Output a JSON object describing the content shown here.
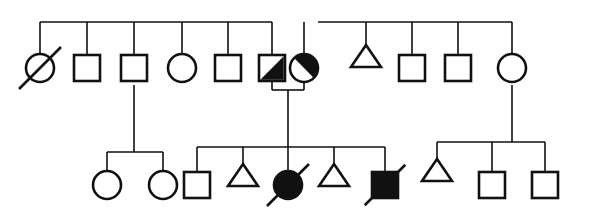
{
  "figure": {
    "kind": "pedigree-chart",
    "title": "",
    "caption": "",
    "width": 593,
    "height": 213,
    "background_color": "#ffffff",
    "ink_color": "#111111",
    "generations": 2,
    "legend_shown": false
  },
  "style": {
    "stroke_color": "#111111",
    "fill_color": "#111111",
    "open_fill": "#ffffff",
    "line_width_thin": 1.6,
    "line_width_shape": 2.6,
    "square_size": 26,
    "circle_radius": 14,
    "triangle_width": 30,
    "triangle_height": 22
  },
  "symbol_legend": {
    "square": "male",
    "circle": "female",
    "triangle": "unknown-sex-or-pregnancy",
    "filled": "affected",
    "half_filled": "carrier-or-partially-affected",
    "slash": "deceased",
    "open": "unaffected"
  },
  "sibship_lines": [
    {
      "id": "gen1-sibship-left",
      "x1": 40,
      "x2": 272,
      "y": 22
    },
    {
      "id": "gen1-sibship-right",
      "x1": 318,
      "x2": 512,
      "y": 22
    },
    {
      "id": "gen2-sibship-a",
      "x1": 107,
      "x2": 163,
      "y": 152
    },
    {
      "id": "gen2-sibship-b",
      "x1": 197,
      "x2": 385,
      "y": 147
    },
    {
      "id": "gen2-sibship-c",
      "x1": 437,
      "x2": 545,
      "y": 142
    }
  ],
  "mating_lines": [
    {
      "id": "mating-gen1-affected-couple",
      "x1": 272,
      "x2": 304,
      "y": 90
    }
  ],
  "descent_lines": [
    {
      "id": "descent-left-sibship-to-gen2a",
      "x1": 134,
      "y1": 85,
      "x2": 134,
      "y2": 152
    },
    {
      "id": "descent-couple-to-gen2b",
      "x1": 288,
      "y1": 90,
      "x2": 288,
      "y2": 147
    },
    {
      "id": "descent-right-female-to-gen2c",
      "x1": 512,
      "y1": 85,
      "x2": 512,
      "y2": 142
    }
  ],
  "generations": [
    {
      "id": "generation-1",
      "label": "Generation I",
      "y_center": 68,
      "individuals": [
        {
          "id": "I-1",
          "name": "deceased-female-open",
          "shape": "circle",
          "fill": "open",
          "deceased": true,
          "cx": 40,
          "cy": 68,
          "stem": {
            "from_y": 22,
            "to_y": 54
          }
        },
        {
          "id": "I-2",
          "name": "male-open",
          "shape": "square",
          "fill": "open",
          "deceased": false,
          "cx": 87,
          "cy": 68,
          "stem": {
            "from_y": 22,
            "to_y": 55
          }
        },
        {
          "id": "I-3",
          "name": "male-open-with-offspring",
          "shape": "square",
          "fill": "open",
          "deceased": false,
          "cx": 134,
          "cy": 68,
          "stem": {
            "from_y": 22,
            "to_y": 55
          }
        },
        {
          "id": "I-4",
          "name": "female-open",
          "shape": "circle",
          "fill": "open",
          "deceased": false,
          "cx": 182,
          "cy": 68,
          "stem": {
            "from_y": 22,
            "to_y": 54
          }
        },
        {
          "id": "I-5",
          "name": "male-open",
          "shape": "square",
          "fill": "open",
          "deceased": false,
          "cx": 228,
          "cy": 68,
          "stem": {
            "from_y": 22,
            "to_y": 55
          }
        },
        {
          "id": "I-6",
          "name": "male-half-filled",
          "shape": "square",
          "fill": "half",
          "deceased": false,
          "cx": 272,
          "cy": 68,
          "stem": {
            "from_y": 22,
            "to_y": 55
          }
        },
        {
          "id": "I-7",
          "name": "female-half-filled",
          "shape": "circle",
          "fill": "half",
          "deceased": false,
          "cx": 304,
          "cy": 68,
          "stem": {
            "from_y": 22,
            "to_y": 54
          }
        },
        {
          "id": "I-8",
          "name": "unknown-sex-triangle",
          "shape": "triangle",
          "fill": "open",
          "deceased": false,
          "cx": 366,
          "cy": 56,
          "stem": {
            "from_y": 22,
            "to_y": 45
          }
        },
        {
          "id": "I-9",
          "name": "male-open",
          "shape": "square",
          "fill": "open",
          "deceased": false,
          "cx": 412,
          "cy": 68,
          "stem": {
            "from_y": 22,
            "to_y": 55
          }
        },
        {
          "id": "I-10",
          "name": "male-open",
          "shape": "square",
          "fill": "open",
          "deceased": false,
          "cx": 458,
          "cy": 68,
          "stem": {
            "from_y": 22,
            "to_y": 55
          }
        },
        {
          "id": "I-11",
          "name": "female-open-with-offspring",
          "shape": "circle",
          "fill": "open",
          "deceased": false,
          "cx": 512,
          "cy": 68,
          "stem": {
            "from_y": 22,
            "to_y": 54
          }
        }
      ]
    },
    {
      "id": "generation-2",
      "label": "Generation II",
      "y_center": 185,
      "individuals": [
        {
          "id": "II-1",
          "name": "female-open",
          "shape": "circle",
          "fill": "open",
          "deceased": false,
          "cx": 107,
          "cy": 185,
          "stem": {
            "from_y": 152,
            "to_y": 171
          }
        },
        {
          "id": "II-2",
          "name": "female-open",
          "shape": "circle",
          "fill": "open",
          "deceased": false,
          "cx": 163,
          "cy": 185,
          "stem": {
            "from_y": 152,
            "to_y": 171
          }
        },
        {
          "id": "II-3",
          "name": "male-open",
          "shape": "square",
          "fill": "open",
          "deceased": false,
          "cx": 197,
          "cy": 185,
          "stem": {
            "from_y": 147,
            "to_y": 172
          }
        },
        {
          "id": "II-4",
          "name": "unknown-sex-triangle",
          "shape": "triangle",
          "fill": "open",
          "deceased": false,
          "cx": 243,
          "cy": 175,
          "stem": {
            "from_y": 147,
            "to_y": 164
          }
        },
        {
          "id": "II-5",
          "name": "deceased-affected-female",
          "shape": "circle",
          "fill": "filled",
          "deceased": true,
          "cx": 288,
          "cy": 185,
          "stem": {
            "from_y": 147,
            "to_y": 171
          }
        },
        {
          "id": "II-6",
          "name": "unknown-sex-triangle",
          "shape": "triangle",
          "fill": "open",
          "deceased": false,
          "cx": 334,
          "cy": 175,
          "stem": {
            "from_y": 147,
            "to_y": 164
          }
        },
        {
          "id": "II-7",
          "name": "deceased-affected-male",
          "shape": "square",
          "fill": "filled",
          "deceased": true,
          "cx": 385,
          "cy": 185,
          "stem": {
            "from_y": 147,
            "to_y": 172
          }
        },
        {
          "id": "II-8",
          "name": "unknown-sex-triangle",
          "shape": "triangle",
          "fill": "open",
          "deceased": false,
          "cx": 437,
          "cy": 170,
          "stem": {
            "from_y": 142,
            "to_y": 159
          }
        },
        {
          "id": "II-9",
          "name": "male-open",
          "shape": "square",
          "fill": "open",
          "deceased": false,
          "cx": 492,
          "cy": 185,
          "stem": {
            "from_y": 142,
            "to_y": 172
          }
        },
        {
          "id": "II-10",
          "name": "male-open",
          "shape": "square",
          "fill": "open",
          "deceased": false,
          "cx": 545,
          "cy": 185,
          "stem": {
            "from_y": 142,
            "to_y": 172
          }
        }
      ]
    }
  ]
}
